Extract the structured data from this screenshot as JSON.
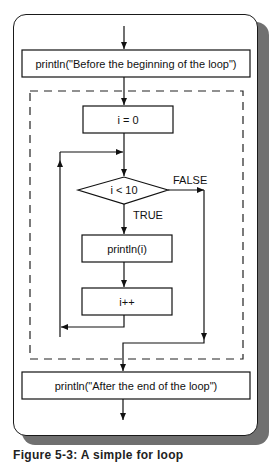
{
  "diagram": {
    "type": "flowchart",
    "nodes": {
      "before": {
        "shape": "rectangle",
        "label": "println(\"Before the beginning of the loop\")"
      },
      "init": {
        "shape": "rectangle",
        "label": "i = 0"
      },
      "condition": {
        "shape": "diamond",
        "label": "i < 10"
      },
      "body": {
        "shape": "rectangle",
        "label": "println(i)"
      },
      "increment": {
        "shape": "rectangle",
        "label": "i++"
      },
      "after": {
        "shape": "rectangle",
        "label": "println(\"After the end of the loop\")"
      }
    },
    "edge_labels": {
      "true": "TRUE",
      "false": "FALSE"
    },
    "edges": [
      {
        "from": "entry",
        "to": "before"
      },
      {
        "from": "before",
        "to": "init"
      },
      {
        "from": "init",
        "to": "condition"
      },
      {
        "from": "condition",
        "to": "body",
        "label": "TRUE"
      },
      {
        "from": "body",
        "to": "increment"
      },
      {
        "from": "increment",
        "to": "condition",
        "note": "loops back"
      },
      {
        "from": "condition",
        "to": "after",
        "label": "FALSE"
      },
      {
        "from": "after",
        "to": "exit"
      }
    ],
    "loop_region": "dashed rectangle enclosing init, condition, body, increment"
  },
  "caption": "Figure 5-3: A simple for loop",
  "colors": {
    "stroke": "#111111",
    "shadow": "#707070",
    "background": "#ffffff"
  }
}
